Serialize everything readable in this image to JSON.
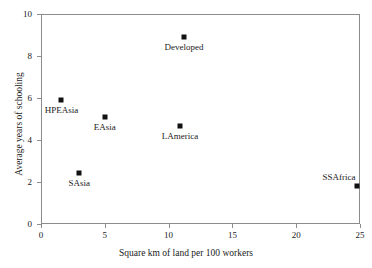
{
  "chart_data": {
    "type": "scatter",
    "title": "",
    "xlabel": "Square km of land per 100 workers",
    "ylabel": "Average years of schooling",
    "xlim": [
      0,
      25
    ],
    "ylim": [
      0,
      10
    ],
    "xticks": [
      "0",
      "5",
      "10",
      "15",
      "20",
      "25"
    ],
    "yticks": [
      "0",
      "2",
      "4",
      "6",
      "8",
      "10"
    ],
    "grid": false,
    "legend": "none",
    "marker_color": "#111111",
    "axis_color": "#8c8c8c",
    "points": [
      {
        "label": "HPEAsia",
        "x": 1.6,
        "y": 5.9,
        "label_pos": "below"
      },
      {
        "label": "EAsia",
        "x": 5.0,
        "y": 5.1,
        "label_pos": "below"
      },
      {
        "label": "SAsia",
        "x": 3.0,
        "y": 2.45,
        "label_pos": "below"
      },
      {
        "label": "Developed",
        "x": 11.2,
        "y": 8.9,
        "label_pos": "below"
      },
      {
        "label": "LAmerica",
        "x": 10.9,
        "y": 4.65,
        "label_pos": "below"
      },
      {
        "label": "SSAfrica",
        "x": 24.8,
        "y": 1.8,
        "label_pos": "above-left"
      }
    ]
  }
}
